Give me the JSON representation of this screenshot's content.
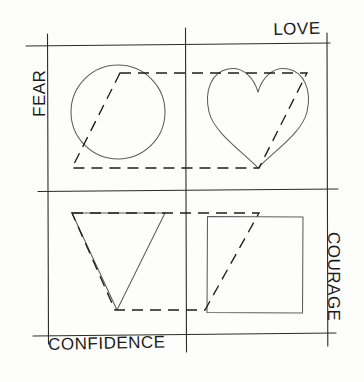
{
  "page": {
    "background_color": "#fdfdfc",
    "width": 364,
    "height": 382
  },
  "axes": {
    "top_label": "LOVE",
    "left_label": "FEAR",
    "bottom_label": "CONFIDENCE",
    "right_label": "COURAGE",
    "line_color": "#2b2b2b",
    "description": "Four hand-drawn axis lines forming a large square grid with crossing tick marks at the corners and midpoints."
  },
  "shapes": {
    "stroke_color": "#5d5d5d",
    "items": [
      {
        "name": "circle",
        "quadrant": "top-left",
        "cx": 118,
        "cy": 112,
        "r": 47
      },
      {
        "name": "heart",
        "quadrant": "top-right",
        "cx": 258,
        "cy": 115,
        "width": 103,
        "height": 100
      },
      {
        "name": "triangle",
        "quadrant": "bottom-left",
        "apex_x": 117,
        "apex_y": 310,
        "top_left_x": 72,
        "top_left_y": 213,
        "top_right_x": 165,
        "top_right_y": 213
      },
      {
        "name": "square",
        "quadrant": "bottom-right",
        "x": 207,
        "y": 216,
        "width": 96,
        "height": 97
      }
    ]
  },
  "dashed_overlay": {
    "stroke_color": "#1d1d1d",
    "dash_pattern": "11 7",
    "description": "Two slanted dashed parallelograms overlaying the grid, running diagonally from lower-left to upper-right.",
    "parallelogram_upper": [
      [
        120,
        73
      ],
      [
        307,
        73
      ],
      [
        259,
        168
      ],
      [
        72,
        168
      ]
    ],
    "parallelogram_lower": [
      [
        72,
        213
      ],
      [
        259,
        213
      ],
      [
        205,
        310
      ],
      [
        115,
        310
      ]
    ]
  },
  "grid": {
    "vertical_lines_x": [
      48,
      186,
      327
    ],
    "horizontal_lines_y": [
      44,
      190,
      334
    ]
  }
}
